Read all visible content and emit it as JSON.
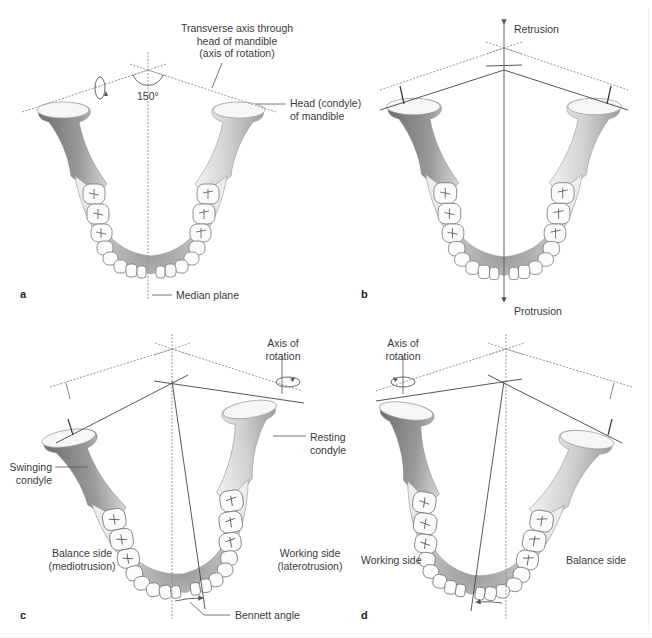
{
  "figure": {
    "panels": [
      {
        "id": "a",
        "label": "a",
        "annotations": {
          "transverse_axis": "Transverse axis through",
          "transverse_axis_2": "head of mandible",
          "transverse_axis_3": "(axis of rotation)",
          "angle": "150°",
          "head_condyle": "Head (condyle)",
          "head_condyle_2": "of mandible",
          "median_plane": "Median plane"
        }
      },
      {
        "id": "b",
        "label": "b",
        "annotations": {
          "retrusion": "Retrusion",
          "protrusion": "Protrusion"
        }
      },
      {
        "id": "c",
        "label": "c",
        "annotations": {
          "axis_rotation": "Axis of",
          "axis_rotation_2": "rotation",
          "resting_condyle": "Resting",
          "resting_condyle_2": "condyle",
          "swinging_condyle": "Swinging",
          "swinging_condyle_2": "condyle",
          "balance_side": "Balance side",
          "balance_side_2": "(mediotrusion)",
          "working_side": "Working side",
          "working_side_2": "(laterotrusion)",
          "bennett_angle": "Bennett angle"
        }
      },
      {
        "id": "d",
        "label": "d",
        "annotations": {
          "axis_rotation": "Axis of",
          "axis_rotation_2": "rotation",
          "working_side": "Working side",
          "balance_side": "Balance side"
        }
      }
    ],
    "colors": {
      "bone_light": "#efefef",
      "bone_mid": "#c9c9c9",
      "bone_dark": "#7d7d7d",
      "line": "#555555",
      "dotted": "#8a8a8a",
      "text": "#3a3a3a"
    }
  }
}
